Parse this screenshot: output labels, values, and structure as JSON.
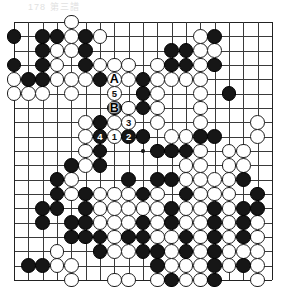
{
  "header": {
    "text": "178    第三譜"
  },
  "board": {
    "size": 19,
    "origin_x": 14.0,
    "origin_y": 22.0,
    "spacing": 14.33,
    "stone_radius": 7.4,
    "line_color": "#3a3a3a",
    "edge_color": "#222222",
    "black_color": "#161616",
    "white_color": "#ffffff",
    "star_points": [
      [
        3,
        3
      ],
      [
        9,
        3
      ],
      [
        15,
        3
      ],
      [
        3,
        9
      ],
      [
        9,
        9
      ],
      [
        15,
        9
      ],
      [
        3,
        15
      ],
      [
        9,
        15
      ],
      [
        15,
        15
      ]
    ],
    "visible_star_points": [
      [
        9,
        9
      ]
    ]
  },
  "stones": {
    "black": [
      [
        0,
        1
      ],
      [
        2,
        1
      ],
      [
        3,
        1
      ],
      [
        5,
        1
      ],
      [
        14,
        1
      ],
      [
        2,
        2
      ],
      [
        5,
        2
      ],
      [
        11,
        2
      ],
      [
        12,
        2
      ],
      [
        0,
        3
      ],
      [
        2,
        3
      ],
      [
        5,
        3
      ],
      [
        11,
        3
      ],
      [
        12,
        3
      ],
      [
        14,
        3
      ],
      [
        1,
        4
      ],
      [
        2,
        4
      ],
      [
        6,
        4
      ],
      [
        9,
        4
      ],
      [
        9,
        5
      ],
      [
        15,
        5
      ],
      [
        7,
        6
      ],
      [
        9,
        6
      ],
      [
        6,
        7
      ],
      [
        8,
        7
      ],
      [
        7,
        8
      ],
      [
        9,
        8
      ],
      [
        13,
        8
      ],
      [
        14,
        8
      ],
      [
        6,
        9
      ],
      [
        10,
        9
      ],
      [
        11,
        9
      ],
      [
        12,
        9
      ],
      [
        4,
        10
      ],
      [
        6,
        10
      ],
      [
        3,
        11
      ],
      [
        8,
        11
      ],
      [
        10,
        11
      ],
      [
        11,
        11
      ],
      [
        16,
        11
      ],
      [
        3,
        12
      ],
      [
        5,
        12
      ],
      [
        9,
        12
      ],
      [
        12,
        12
      ],
      [
        17,
        12
      ],
      [
        2,
        13
      ],
      [
        3,
        13
      ],
      [
        5,
        13
      ],
      [
        11,
        13
      ],
      [
        14,
        13
      ],
      [
        16,
        13
      ],
      [
        17,
        13
      ],
      [
        2,
        14
      ],
      [
        4,
        14
      ],
      [
        5,
        14
      ],
      [
        9,
        14
      ],
      [
        11,
        14
      ],
      [
        14,
        14
      ],
      [
        16,
        14
      ],
      [
        4,
        15
      ],
      [
        5,
        15
      ],
      [
        6,
        15
      ],
      [
        8,
        15
      ],
      [
        9,
        15
      ],
      [
        12,
        15
      ],
      [
        14,
        15
      ],
      [
        16,
        15
      ],
      [
        6,
        16
      ],
      [
        9,
        16
      ],
      [
        10,
        16
      ],
      [
        12,
        16
      ],
      [
        14,
        16
      ],
      [
        1,
        17
      ],
      [
        2,
        17
      ],
      [
        10,
        17
      ],
      [
        14,
        17
      ],
      [
        16,
        17
      ],
      [
        11,
        18
      ],
      [
        14,
        18
      ]
    ],
    "white": [
      [
        4,
        0
      ],
      [
        4,
        1
      ],
      [
        6,
        1
      ],
      [
        13,
        1
      ],
      [
        3,
        2
      ],
      [
        4,
        2
      ],
      [
        13,
        2
      ],
      [
        14,
        2
      ],
      [
        3,
        3
      ],
      [
        6,
        3
      ],
      [
        7,
        3
      ],
      [
        8,
        3
      ],
      [
        10,
        3
      ],
      [
        13,
        3
      ],
      [
        0,
        4
      ],
      [
        3,
        4
      ],
      [
        4,
        4
      ],
      [
        5,
        4
      ],
      [
        7,
        4
      ],
      [
        8,
        4
      ],
      [
        10,
        4
      ],
      [
        11,
        4
      ],
      [
        12,
        4
      ],
      [
        13,
        4
      ],
      [
        0,
        5
      ],
      [
        1,
        5
      ],
      [
        2,
        5
      ],
      [
        4,
        5
      ],
      [
        7,
        5
      ],
      [
        10,
        5
      ],
      [
        13,
        5
      ],
      [
        8,
        6
      ],
      [
        10,
        6
      ],
      [
        13,
        6
      ],
      [
        5,
        7
      ],
      [
        7,
        7
      ],
      [
        10,
        7
      ],
      [
        13,
        7
      ],
      [
        17,
        7
      ],
      [
        5,
        8
      ],
      [
        11,
        8
      ],
      [
        12,
        8
      ],
      [
        17,
        8
      ],
      [
        5,
        9
      ],
      [
        13,
        9
      ],
      [
        15,
        9
      ],
      [
        16,
        9
      ],
      [
        5,
        10
      ],
      [
        12,
        10
      ],
      [
        13,
        10
      ],
      [
        15,
        10
      ],
      [
        16,
        10
      ],
      [
        4,
        11
      ],
      [
        12,
        11
      ],
      [
        13,
        11
      ],
      [
        14,
        11
      ],
      [
        15,
        11
      ],
      [
        4,
        12
      ],
      [
        6,
        12
      ],
      [
        7,
        12
      ],
      [
        8,
        12
      ],
      [
        10,
        12
      ],
      [
        13,
        12
      ],
      [
        14,
        12
      ],
      [
        15,
        12
      ],
      [
        6,
        13
      ],
      [
        7,
        13
      ],
      [
        8,
        13
      ],
      [
        9,
        13
      ],
      [
        10,
        13
      ],
      [
        12,
        13
      ],
      [
        13,
        13
      ],
      [
        15,
        13
      ],
      [
        6,
        14
      ],
      [
        7,
        14
      ],
      [
        8,
        14
      ],
      [
        10,
        14
      ],
      [
        12,
        14
      ],
      [
        13,
        14
      ],
      [
        15,
        14
      ],
      [
        17,
        14
      ],
      [
        7,
        15
      ],
      [
        10,
        15
      ],
      [
        11,
        15
      ],
      [
        13,
        15
      ],
      [
        15,
        15
      ],
      [
        17,
        15
      ],
      [
        3,
        16
      ],
      [
        7,
        16
      ],
      [
        8,
        16
      ],
      [
        11,
        16
      ],
      [
        13,
        16
      ],
      [
        15,
        16
      ],
      [
        16,
        16
      ],
      [
        17,
        16
      ],
      [
        3,
        17
      ],
      [
        4,
        17
      ],
      [
        11,
        17
      ],
      [
        12,
        17
      ],
      [
        13,
        17
      ],
      [
        15,
        17
      ],
      [
        17,
        17
      ],
      [
        4,
        18
      ],
      [
        7,
        18
      ],
      [
        8,
        18
      ],
      [
        10,
        18
      ],
      [
        12,
        18
      ],
      [
        13,
        18
      ],
      [
        17,
        18
      ]
    ]
  },
  "move_markers": [
    {
      "label": "1",
      "color": "white",
      "col": 7,
      "row": 8,
      "name": "move-1"
    },
    {
      "label": "2",
      "color": "black",
      "col": 8,
      "row": 8,
      "name": "move-2"
    },
    {
      "label": "3",
      "color": "white",
      "col": 8,
      "row": 7,
      "name": "move-3"
    },
    {
      "label": "4",
      "color": "black",
      "col": 6,
      "row": 8,
      "name": "move-4"
    },
    {
      "label": "5",
      "color": "white",
      "col": 7,
      "row": 5,
      "name": "move-5"
    }
  ],
  "point_labels": [
    {
      "label": "A",
      "col": 7,
      "row": 4,
      "name": "point-label-a"
    },
    {
      "label": "B",
      "col": 7,
      "row": 6,
      "name": "point-label-b"
    }
  ]
}
